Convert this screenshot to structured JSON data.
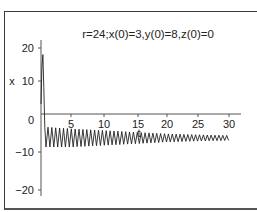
{
  "chart_data": {
    "type": "line",
    "title": "r=24;x(0)=3,y(0)=8,z(0)=0",
    "xlabel": "t",
    "ylabel": "x",
    "xlim": [
      0,
      31
    ],
    "ylim": [
      -22,
      22
    ],
    "x_ticks": [
      5,
      10,
      15,
      20,
      25,
      30
    ],
    "y_ticks": [
      20,
      10,
      0,
      -10,
      -20
    ],
    "grid": false,
    "legend": null,
    "series": [
      {
        "name": "x(t)",
        "description": "Lorenz system x-component: starts at 3, spikes to about 18 near t≈0.3, drops below 0 by t≈0.6, then oscillates with decaying amplitude around x≈-7.5",
        "x": [
          0,
          0.15,
          0.3,
          0.45,
          0.6,
          0.8,
          1,
          2,
          5,
          10,
          15,
          20,
          25,
          30
        ],
        "values": [
          3,
          14,
          18,
          8,
          -4,
          -10,
          -4,
          -9.5,
          -4.5,
          -9,
          -5.5,
          -8.5,
          -6.5,
          -7.5
        ],
        "envelope": {
          "t": [
            1,
            5,
            10,
            15,
            20,
            25,
            30
          ],
          "upper": [
            -4,
            -4.5,
            -5,
            -5.5,
            -6,
            -6.3,
            -6.5
          ],
          "lower": [
            -10,
            -10,
            -9.5,
            -9,
            -8.5,
            -8.2,
            -8
          ]
        },
        "oscillation_period": 0.62,
        "color": "#222222"
      }
    ]
  },
  "labels": {
    "title": "r=24;x(0)=3,y(0)=8,z(0)=0",
    "xlabel": "t",
    "ylabel": "x",
    "xticks": [
      "5",
      "10",
      "15",
      "20",
      "25",
      "30"
    ],
    "yticks": [
      "20",
      "10",
      "0",
      "−10",
      "−20"
    ]
  }
}
